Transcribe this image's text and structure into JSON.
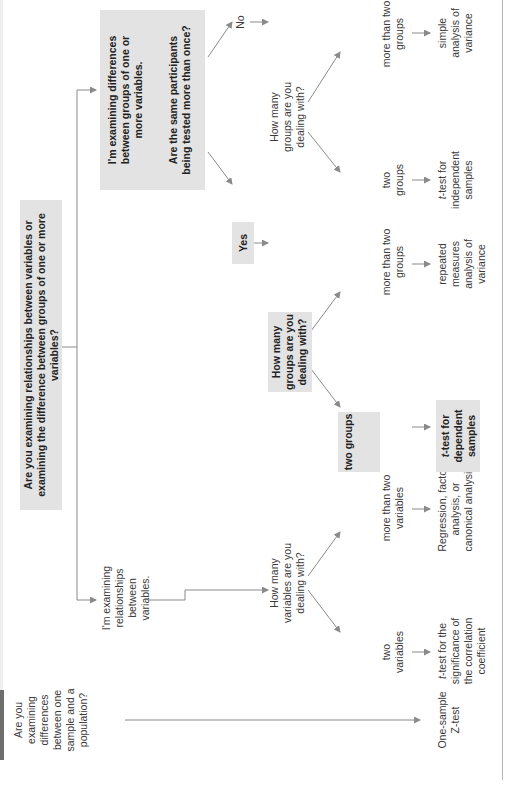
{
  "diagram": {
    "orientation": "rotated 90 degrees counter-clockwise",
    "root": {
      "question": "Are you examining relationships between variables or examining the difference between groups of one or more variables?"
    },
    "side_question": "Are you examining differences between one sample and a population?",
    "side_result": "One-sample Z-test",
    "relationships_branch": {
      "label": "I'm examining relationships between variables.",
      "question": "How many variables are you dealing with?",
      "options": [
        {
          "label": "two variables",
          "result_prefix": "t",
          "result": "-test for the significance of the correlation coefficient"
        },
        {
          "label": "more than two variables",
          "result": "Regression, factor analysis, or canonical analysis"
        }
      ]
    },
    "differences_branch": {
      "label": "I'm examining differences between groups of one or more variables.",
      "question": "Are the same participants being tested more than once?",
      "yes": {
        "label": "Yes",
        "question": "How many groups are you dealing with?",
        "options": [
          {
            "label": "two groups",
            "result_prefix": "t",
            "result": "-test for dependent samples",
            "highlighted": true
          },
          {
            "label": "more than two groups",
            "result": "repeated measures analysis of variance"
          }
        ]
      },
      "no": {
        "label": "No",
        "question": "How many groups are you dealing with?",
        "options": [
          {
            "label": "two groups",
            "result_prefix": "t",
            "result": "-test for independent samples"
          },
          {
            "label": "more than two groups",
            "result": "simple analysis of variance"
          }
        ]
      }
    },
    "colors": {
      "box_fill": "#e3e3e3",
      "line": "#8a8a8a",
      "text": "#3a3a3a",
      "band_dark": "#6e6e6e",
      "band_light": "#efefef"
    }
  }
}
